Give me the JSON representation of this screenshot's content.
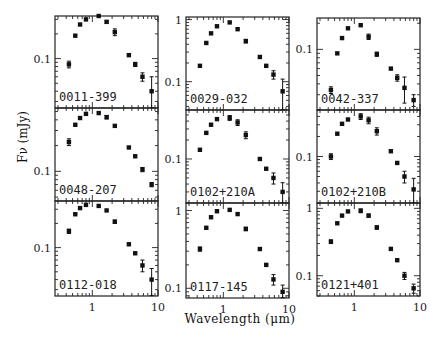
{
  "figure": {
    "ylabel": "Fν (mJy)",
    "xlabel": "Wavelength (μm)",
    "x_ticks": [
      "1",
      "10"
    ]
  },
  "chart_data": {
    "type": "scatter",
    "xscale": "log",
    "yscale": "log",
    "xlabel": "Wavelength (μm)",
    "ylabel": "Fν (mJy)",
    "xlim": [
      0.27,
      10
    ],
    "grid": false,
    "x": [
      0.44,
      0.55,
      0.65,
      0.8,
      1.25,
      1.65,
      2.2,
      3.6,
      4.5,
      5.8,
      8.0
    ],
    "panels": [
      {
        "name": "0011-399",
        "ylim": [
          0.025,
          0.33
        ],
        "yticks": [
          "0.1"
        ],
        "values": [
          0.085,
          0.19,
          0.26,
          0.3,
          0.33,
          0.28,
          0.21,
          0.11,
          0.085,
          0.06,
          0.04
        ],
        "err": [
          0.008,
          0,
          0,
          0,
          0,
          0.01,
          0.02,
          0,
          0.005,
          0.007,
          0.02
        ]
      },
      {
        "name": "0029-032",
        "ylim": [
          0.035,
          1.1
        ],
        "yticks": [
          "1",
          "0.1"
        ],
        "values": [
          0.18,
          0.42,
          0.6,
          0.78,
          0.9,
          0.7,
          0.45,
          0.25,
          0.18,
          0.13,
          0.07
        ],
        "err": [
          0,
          0,
          0,
          0,
          0,
          0,
          0.03,
          0,
          0,
          0.02,
          0.04
        ]
      },
      {
        "name": "0042-337",
        "ylim": [
          0.02,
          0.23
        ],
        "yticks": [
          "0.1"
        ],
        "values": [
          0.034,
          0.09,
          0.135,
          0.175,
          0.19,
          0.14,
          0.088,
          0.06,
          0.047,
          0.036,
          0.026
        ],
        "err": [
          0.003,
          0,
          0,
          0,
          0,
          0.01,
          0.005,
          0,
          0.004,
          0.012,
          0.004
        ]
      },
      {
        "name": "0048-207",
        "ylim": [
          0.045,
          0.55
        ],
        "yticks": [
          "0.1"
        ],
        "values": [
          0.22,
          0.35,
          0.42,
          0.47,
          0.48,
          0.43,
          0.34,
          0.19,
          0.15,
          0.105,
          0.07
        ],
        "err": [
          0.02,
          0,
          0,
          0,
          0,
          0.02,
          0,
          0,
          0,
          0.006,
          0.004
        ]
      },
      {
        "name": "0102+210A",
        "ylim": [
          0.02,
          0.6
        ],
        "yticks": [
          "0.1"
        ],
        "values": [
          0.14,
          0.26,
          0.35,
          0.43,
          0.45,
          0.38,
          0.24,
          0.1,
          0.07,
          0.05,
          0.03
        ],
        "err": [
          0,
          0,
          0,
          0,
          0.04,
          0.04,
          0.03,
          0,
          0,
          0.01,
          0.012
        ]
      },
      {
        "name": "0102+210B",
        "ylim": [
          0.02,
          0.5
        ],
        "yticks": [
          "0.1"
        ],
        "values": [
          0.1,
          0.22,
          0.31,
          0.36,
          0.4,
          0.35,
          0.24,
          0.12,
          0.08,
          0.05,
          0.032
        ],
        "err": [
          0.01,
          0,
          0,
          0,
          0.04,
          0.04,
          0.03,
          0,
          0,
          0.01,
          0.015
        ]
      },
      {
        "name": "0112-018",
        "ylim": [
          0.025,
          0.38
        ],
        "yticks": [
          "0.1"
        ],
        "values": [
          0.16,
          0.26,
          0.31,
          0.34,
          0.33,
          0.29,
          0.21,
          0.11,
          0.085,
          0.06,
          0.04
        ],
        "err": [
          0.01,
          0,
          0,
          0,
          0,
          0,
          0.01,
          0,
          0,
          0.01,
          0.015
        ]
      },
      {
        "name": "0117-145",
        "ylim": [
          0.075,
          1.25
        ],
        "yticks": [
          "1",
          "0.1"
        ],
        "values": [
          0.32,
          0.6,
          0.82,
          0.98,
          1.02,
          0.9,
          0.58,
          0.32,
          0.2,
          0.13,
          0.09
        ],
        "err": [
          0.02,
          0,
          0,
          0,
          0,
          0,
          0.03,
          0,
          0,
          0.02,
          0.02
        ]
      },
      {
        "name": "0121+401",
        "ylim": [
          0.05,
          1.2
        ],
        "yticks": [
          "1",
          "0.1"
        ],
        "values": [
          0.32,
          0.6,
          0.78,
          0.9,
          0.92,
          0.78,
          0.52,
          0.25,
          0.17,
          0.1,
          0.065
        ],
        "err": [
          0.02,
          0,
          0,
          0,
          0.06,
          0.04,
          0.03,
          0,
          0,
          0.012,
          0.01
        ]
      }
    ]
  }
}
